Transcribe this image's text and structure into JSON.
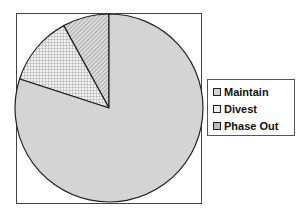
{
  "chart_data": {
    "type": "pie",
    "title": "",
    "categories": [
      "Maintain",
      "Divest",
      "Phase Out"
    ],
    "values": [
      80,
      12,
      8
    ],
    "start_angle": "12 o'clock, counter-clockwise order Phase Out, Divest, Maintain",
    "legend_position": "right",
    "fills": {
      "Maintain": "solid light gray #d4d4d4",
      "Divest": "crosshatch light gray",
      "Phase Out": "diagonal hatch gray"
    }
  },
  "legend": {
    "items": [
      {
        "label": "Maintain"
      },
      {
        "label": "Divest"
      },
      {
        "label": "Phase Out"
      }
    ]
  }
}
